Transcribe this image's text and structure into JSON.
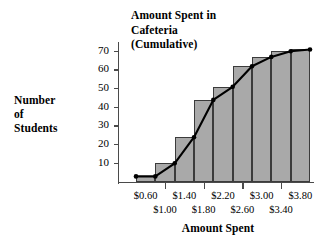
{
  "chart_data": {
    "type": "bar",
    "title": "Amount Spent in Cafeteria (Cumulative)",
    "title_lines": [
      "Amount Spent in",
      "Cafeteria",
      "(Cumulative)"
    ],
    "xlabel": "Amount Spent",
    "ylabel": "Number of Students",
    "ylabel_lines": [
      "Number",
      "of",
      "Students"
    ],
    "categories": [
      "$0.60",
      "$1.00",
      "$1.40",
      "$1.80",
      "$2.20",
      "$2.60",
      "$3.00",
      "$3.40",
      "$3.80"
    ],
    "values": [
      3,
      10,
      24,
      44,
      51,
      62,
      67,
      70,
      71
    ],
    "series": [
      {
        "name": "Cumulative bars",
        "values": [
          3,
          10,
          24,
          44,
          51,
          62,
          67,
          70,
          71
        ]
      },
      {
        "name": "Cumulative line",
        "type": "line",
        "values": [
          3,
          10,
          24,
          44,
          51,
          62,
          67,
          70,
          71
        ]
      }
    ],
    "ylim": [
      0,
      75
    ],
    "xlim_labels_top": [
      "$0.60",
      "$1.40",
      "$2.20",
      "$3.00",
      "$3.80"
    ],
    "xlim_labels_bottom": [
      "$1.00",
      "$1.80",
      "$2.60",
      "$3.40"
    ],
    "ytick_labels": [
      "10",
      "20",
      "30",
      "40",
      "50",
      "60",
      "70"
    ],
    "ytick_values": [
      10,
      20,
      30,
      40,
      50,
      60,
      70
    ],
    "grid": false,
    "legend": "none",
    "colors": {
      "bar_fill": "#a9a9a9",
      "bar_stroke": "#3b3b3b",
      "line": "#000000",
      "axis": "#4a4a4a",
      "text": "#000000",
      "background": "#ffffff"
    }
  }
}
